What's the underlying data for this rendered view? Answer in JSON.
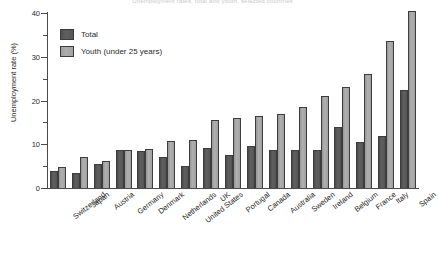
{
  "chart_data": {
    "type": "bar",
    "title": "Unemployment rates, total and youth, selected countries",
    "xlabel": "",
    "ylabel": "Unemployment rate (%)",
    "ylim": [
      0,
      40
    ],
    "yticks": [
      0,
      10,
      20,
      30,
      40
    ],
    "yticks_minor": [
      5,
      15,
      25,
      35
    ],
    "grid": false,
    "legend_position": "top-left",
    "categories": [
      "Switzerland",
      "Japan",
      "Austria",
      "Germany",
      "Denmark",
      "Netherlands",
      "United States",
      "UK",
      "Portugal",
      "Canada",
      "Australia",
      "Sweden",
      "Ireland",
      "Belgium",
      "France",
      "Italy",
      "Spain"
    ],
    "series": [
      {
        "name": "Total",
        "color": "#575757",
        "values": [
          4.0,
          3.4,
          5.6,
          8.7,
          8.5,
          7.2,
          5.0,
          9.2,
          7.5,
          9.7,
          8.8,
          8.8,
          8.8,
          14.0,
          10.5,
          11.8,
          22.5
        ]
      },
      {
        "name": "Youth (under 25 years)",
        "color": "#a2a2a2",
        "values": [
          4.8,
          7.0,
          6.2,
          8.8,
          8.9,
          10.8,
          11.0,
          15.6,
          16.0,
          16.5,
          17.0,
          18.5,
          21.0,
          23.2,
          26.0,
          33.5,
          40.5
        ]
      }
    ]
  },
  "legend": {
    "items": [
      {
        "label": "Total"
      },
      {
        "label": "Youth (under 25 years)"
      }
    ]
  }
}
